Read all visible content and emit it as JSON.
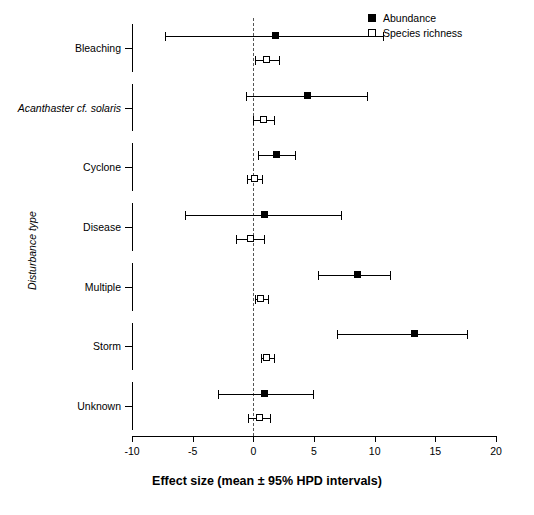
{
  "chart_data": {
    "type": "scatter",
    "title": "",
    "xlabel": "Effect size (mean ± 95% HPD intervals)",
    "ylabel": "Disturbance type",
    "xlim": [
      -10,
      20
    ],
    "xticks": [
      -10,
      -5,
      0,
      5,
      10,
      15,
      20
    ],
    "xtick_labels": [
      "-10",
      "-5",
      "0",
      "5",
      "10",
      "15",
      "20"
    ],
    "grid": false,
    "zero_reference_line": 0,
    "legend_position": "top-right",
    "categories": [
      "Bleaching",
      "Acanthaster cf. solaris",
      "Cyclone",
      "Disease",
      "Multiple",
      "Storm",
      "Unknown"
    ],
    "category_styles": [
      "normal",
      "italic",
      "normal",
      "normal",
      "normal",
      "normal",
      "normal"
    ],
    "series": [
      {
        "name": "Abundance",
        "marker": "filled-square",
        "values": [
          1.8,
          4.5,
          1.9,
          0.9,
          8.6,
          13.3,
          0.9
        ],
        "ci_low": [
          -7.3,
          -0.6,
          0.4,
          -5.6,
          5.3,
          6.9,
          -2.9
        ],
        "ci_high": [
          10.7,
          9.4,
          3.4,
          7.2,
          11.3,
          17.6,
          4.9
        ]
      },
      {
        "name": "Species richness",
        "marker": "open-square",
        "values": [
          1.1,
          0.8,
          0.1,
          -0.2,
          0.6,
          1.1,
          0.5
        ],
        "ci_low": [
          0.1,
          0.0,
          -0.5,
          -1.4,
          0.1,
          0.6,
          -0.4
        ],
        "ci_high": [
          2.1,
          1.7,
          0.7,
          0.9,
          1.2,
          1.7,
          1.4
        ]
      }
    ]
  },
  "legend": {
    "items": [
      {
        "label": "Abundance",
        "marker": "filled-square"
      },
      {
        "label": "Species richness",
        "marker": "open-square"
      }
    ]
  },
  "axes": {
    "x_title": "Effect size (mean ± 95% HPD intervals)",
    "y_title": "Disturbance type"
  }
}
